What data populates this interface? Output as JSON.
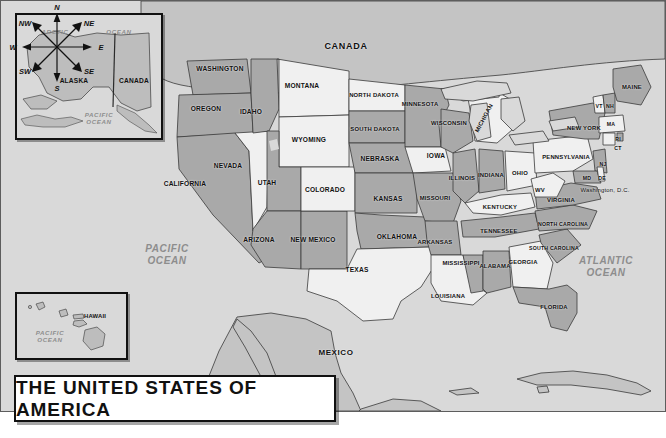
{
  "title_plate": {
    "text": "THE UNITED STATES OF AMERICA"
  },
  "country_labels": [
    {
      "name": "canada",
      "text": "CANADA"
    },
    {
      "name": "mexico",
      "text": "MEXICO"
    }
  ],
  "ocean_labels": [
    {
      "name": "pacific-ocean-main",
      "text": "PACIFIC\nOCEAN"
    },
    {
      "name": "atlantic-ocean",
      "text": "ATLANTIC\nOCEAN"
    },
    {
      "name": "arctic-ocean-inset",
      "text": "ARCTIC"
    },
    {
      "name": "arctic-ocean-inset-2",
      "text": "OCEAN"
    },
    {
      "name": "pacific-ocean-alaska-inset",
      "text": "PACIFIC\nOCEAN"
    },
    {
      "name": "pacific-ocean-hawaii-inset",
      "text": "PACIFIC\nOCEAN"
    }
  ],
  "insets": {
    "alaska": {
      "state": "ALASKA",
      "neighbor": "CANADA"
    },
    "hawaii": {
      "state": "HAWAII"
    }
  },
  "compass": {
    "points": [
      "N",
      "NE",
      "E",
      "SE",
      "S",
      "SW",
      "W",
      "NW"
    ]
  },
  "states": [
    {
      "name": "washington",
      "label": "WASHINGTON",
      "x": 219,
      "y": 68,
      "size": "s9",
      "fill": "dark"
    },
    {
      "name": "oregon",
      "label": "OREGON",
      "x": 205,
      "y": 108,
      "size": "s9",
      "fill": "dark"
    },
    {
      "name": "idaho",
      "label": "IDAHO",
      "x": 250,
      "y": 111,
      "size": "s9",
      "fill": "dark"
    },
    {
      "name": "montana",
      "label": "MONTANA",
      "x": 301,
      "y": 85,
      "size": "s9",
      "fill": "light"
    },
    {
      "name": "wyoming",
      "label": "WYOMING",
      "x": 308,
      "y": 139,
      "size": "s9",
      "fill": "light"
    },
    {
      "name": "nevada",
      "label": "NEVADA",
      "x": 227,
      "y": 165,
      "size": "s9",
      "fill": "light"
    },
    {
      "name": "utah",
      "label": "UTAH",
      "x": 266,
      "y": 182,
      "size": "s9",
      "fill": "dark"
    },
    {
      "name": "california",
      "label": "CALIFORNIA",
      "x": 184,
      "y": 183,
      "size": "s9",
      "fill": "dark"
    },
    {
      "name": "arizona",
      "label": "ARIZONA",
      "x": 258,
      "y": 239,
      "size": "s9",
      "fill": "dark"
    },
    {
      "name": "new-mexico",
      "label": "NEW MEXICO",
      "x": 312,
      "y": 239,
      "size": "s9",
      "fill": "dark"
    },
    {
      "name": "colorado",
      "label": "COLORADO",
      "x": 324,
      "y": 189,
      "size": "s9",
      "fill": "light"
    },
    {
      "name": "north-dakota",
      "label": "NORTH DAKOTA",
      "x": 373,
      "y": 94,
      "size": "s8",
      "fill": "light"
    },
    {
      "name": "south-dakota",
      "label": "SOUTH DAKOTA",
      "x": 374,
      "y": 128,
      "size": "s8",
      "fill": "dark"
    },
    {
      "name": "nebraska",
      "label": "NEBRASKA",
      "x": 379,
      "y": 158,
      "size": "s9",
      "fill": "dark"
    },
    {
      "name": "kansas",
      "label": "KANSAS",
      "x": 387,
      "y": 198,
      "size": "s9",
      "fill": "dark"
    },
    {
      "name": "oklahoma",
      "label": "OKLAHOMA",
      "x": 396,
      "y": 236,
      "size": "s9",
      "fill": "dark"
    },
    {
      "name": "texas",
      "label": "TEXAS",
      "x": 356,
      "y": 269,
      "size": "s9",
      "fill": "light"
    },
    {
      "name": "minnesota",
      "label": "MINNESOTA",
      "x": 419,
      "y": 103,
      "size": "s8",
      "fill": "dark"
    },
    {
      "name": "iowa",
      "label": "IOWA",
      "x": 435,
      "y": 155,
      "size": "s9",
      "fill": "light"
    },
    {
      "name": "missouri",
      "label": "MISSOURI",
      "x": 434,
      "y": 197,
      "size": "s8",
      "fill": "dark"
    },
    {
      "name": "arkansas",
      "label": "ARKANSAS",
      "x": 434,
      "y": 241,
      "size": "s8",
      "fill": "dark"
    },
    {
      "name": "louisiana",
      "label": "LOUISIANA",
      "x": 447,
      "y": 295,
      "size": "s8",
      "fill": "light"
    },
    {
      "name": "mississippi",
      "label": "MISSISSIPPI",
      "x": 460,
      "y": 262,
      "size": "s8",
      "fill": "dark"
    },
    {
      "name": "alabama",
      "label": "ALABAMA",
      "x": 494,
      "y": 265,
      "size": "s8",
      "fill": "dark"
    },
    {
      "name": "wisconsin",
      "label": "WISCONSIN",
      "x": 448,
      "y": 122,
      "size": "s8",
      "fill": "dark"
    },
    {
      "name": "illinois",
      "label": "ILLINOIS",
      "x": 461,
      "y": 177,
      "size": "s8",
      "fill": "dark"
    },
    {
      "name": "indiana",
      "label": "INDIANA",
      "x": 490,
      "y": 174,
      "size": "s8",
      "fill": "dark"
    },
    {
      "name": "ohio",
      "label": "OHIO",
      "x": 519,
      "y": 172,
      "size": "s8",
      "fill": "light"
    },
    {
      "name": "michigan",
      "label": "MICHIGAN",
      "x": 483,
      "y": 117,
      "size": "s8",
      "fill": "light",
      "rot": -62
    },
    {
      "name": "kentucky",
      "label": "KENTUCKY",
      "x": 499,
      "y": 206,
      "size": "s8",
      "fill": "light"
    },
    {
      "name": "tennessee",
      "label": "TENNESSEE",
      "x": 498,
      "y": 230,
      "size": "s8",
      "fill": "dark"
    },
    {
      "name": "georgia",
      "label": "GEORGIA",
      "x": 522,
      "y": 261,
      "size": "s8",
      "fill": "light"
    },
    {
      "name": "florida",
      "label": "FLORIDA",
      "x": 553,
      "y": 306,
      "size": "s8",
      "fill": "dark"
    },
    {
      "name": "south-carolina",
      "label": "SOUTH\nCAROLINA",
      "x": 553,
      "y": 248,
      "size": "s7",
      "fill": "dark"
    },
    {
      "name": "north-carolina",
      "label": "NORTH\nCAROLINA",
      "x": 562,
      "y": 224,
      "size": "s7",
      "fill": "dark"
    },
    {
      "name": "virginia",
      "label": "VIRGINIA",
      "x": 560,
      "y": 199,
      "size": "s8",
      "fill": "dark"
    },
    {
      "name": "west-virginia",
      "label": "WV",
      "x": 539,
      "y": 189,
      "size": "s8",
      "fill": "light"
    },
    {
      "name": "pennsylvania",
      "label": "PENNSYLVANIA",
      "x": 565,
      "y": 156,
      "size": "s8",
      "fill": "light"
    },
    {
      "name": "new-york",
      "label": "NEW\nYORK",
      "x": 583,
      "y": 127,
      "size": "s8",
      "fill": "dark"
    },
    {
      "name": "vermont",
      "label": "VT",
      "x": 598,
      "y": 106,
      "size": "s7",
      "fill": "light"
    },
    {
      "name": "new-hampshire",
      "label": "NH",
      "x": 609,
      "y": 106,
      "size": "s7",
      "fill": "dark"
    },
    {
      "name": "maine",
      "label": "MAINE",
      "x": 631,
      "y": 86,
      "size": "s8",
      "fill": "dark"
    },
    {
      "name": "massachusetts",
      "label": "MA",
      "x": 610,
      "y": 124,
      "size": "s7",
      "fill": "light"
    },
    {
      "name": "rhode-island",
      "label": "RI",
      "x": 617,
      "y": 139,
      "size": "s7",
      "fill": "dark"
    },
    {
      "name": "connecticut",
      "label": "CT",
      "x": 617,
      "y": 148,
      "size": "s7",
      "fill": "light"
    },
    {
      "name": "new-jersey",
      "label": "NJ",
      "x": 602,
      "y": 164,
      "size": "s7",
      "fill": "dark"
    },
    {
      "name": "maryland",
      "label": "MD",
      "x": 586,
      "y": 178,
      "size": "s7",
      "fill": "dark"
    },
    {
      "name": "delaware",
      "label": "DE",
      "x": 601,
      "y": 178,
      "size": "s7",
      "fill": "light"
    },
    {
      "name": "washington-dc",
      "label": "Washington, D.C.",
      "x": 604,
      "y": 189,
      "size": "s8",
      "fill": "none",
      "plain": true
    }
  ]
}
